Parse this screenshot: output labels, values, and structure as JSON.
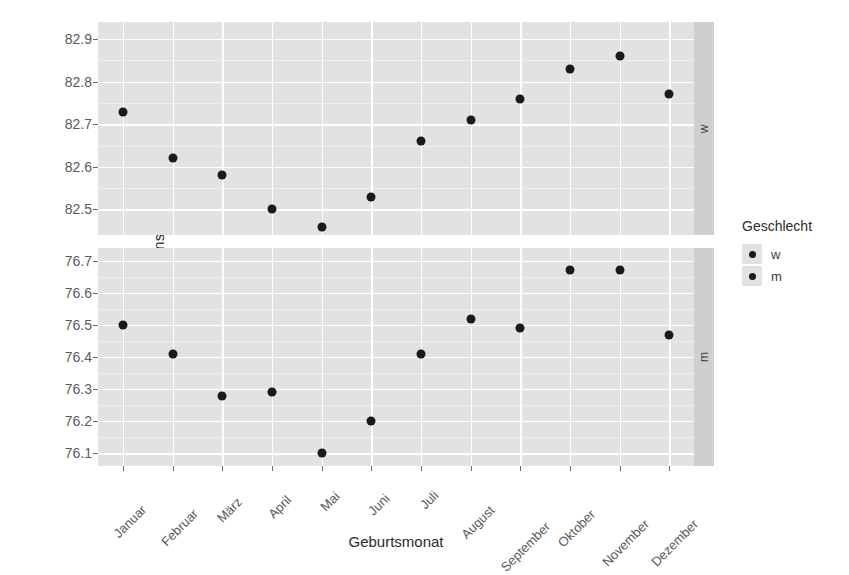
{
  "chart_data": {
    "type": "scatter",
    "title": "",
    "xlabel": "Geburtsmonat",
    "ylabel": "Lebensdauer Jahre",
    "grid": true,
    "legend_position": "right",
    "legend_title": "Geschlecht",
    "legend_entries": [
      "w",
      "m"
    ],
    "facet_variable": "Geschlecht",
    "facets": [
      {
        "strip_label": "w",
        "ylim": [
          82.44,
          82.94
        ],
        "yticks": [
          "82.5",
          "82.6",
          "82.7",
          "82.8",
          "82.9"
        ],
        "ytick_values": [
          82.5,
          82.6,
          82.7,
          82.8,
          82.9
        ]
      },
      {
        "strip_label": "m",
        "ylim": [
          76.06,
          76.74
        ],
        "yticks": [
          "76.1",
          "76.2",
          "76.3",
          "76.4",
          "76.5",
          "76.6",
          "76.7"
        ],
        "ytick_values": [
          76.1,
          76.2,
          76.3,
          76.4,
          76.5,
          76.6,
          76.7
        ]
      }
    ],
    "categories": [
      "Januar",
      "Februar",
      "März",
      "April",
      "Mai",
      "Juni",
      "Juli",
      "August",
      "September",
      "Oktober",
      "November",
      "Dezember"
    ],
    "series": [
      {
        "name": "w",
        "facet": "w",
        "values": [
          82.73,
          82.62,
          82.58,
          82.5,
          82.46,
          82.53,
          82.66,
          82.71,
          82.76,
          82.83,
          82.86,
          82.77
        ]
      },
      {
        "name": "m",
        "facet": "m",
        "values": [
          76.5,
          76.41,
          76.28,
          76.29,
          76.1,
          76.2,
          76.41,
          76.52,
          76.49,
          76.67,
          76.67,
          76.47
        ]
      }
    ],
    "point_color": "#1a1a1a",
    "panel_background": "#e2e2e2",
    "grid_color": "#ffffff",
    "strip_background": "#cfcfcf"
  }
}
